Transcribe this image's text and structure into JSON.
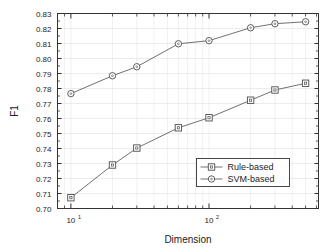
{
  "chart_data": {
    "type": "line",
    "title": "",
    "xlabel": "Dimension",
    "ylabel": "F1",
    "xscale": "log",
    "xlim": [
      8,
      620
    ],
    "ylim": [
      0.7,
      0.83
    ],
    "grid": true,
    "legend_position": "lower right",
    "x": [
      10,
      20,
      30,
      60,
      100,
      200,
      300,
      500
    ],
    "xtick_labels": [
      "10",
      "10"
    ],
    "xtick_exponents": [
      "1",
      "2"
    ],
    "xtick_values": [
      10,
      100
    ],
    "ytick_labels": [
      "0.70",
      "0.71",
      "0.72",
      "0.73",
      "0.74",
      "0.75",
      "0.76",
      "0.77",
      "0.78",
      "0.79",
      "0.80",
      "0.81",
      "0.82",
      "0.83"
    ],
    "ytick_values": [
      0.7,
      0.71,
      0.72,
      0.73,
      0.74,
      0.75,
      0.76,
      0.77,
      0.78,
      0.79,
      0.8,
      0.81,
      0.82,
      0.83
    ],
    "series": [
      {
        "name": "Rule-based",
        "marker": "square",
        "color": "#4d4d4d",
        "values": [
          0.7072,
          0.729,
          0.7403,
          0.7538,
          0.7605,
          0.7722,
          0.779,
          0.7835
        ]
      },
      {
        "name": "SVM-based",
        "marker": "circle",
        "color": "#4d4d4d",
        "values": [
          0.7766,
          0.7885,
          0.7945,
          0.8098,
          0.8119,
          0.8205,
          0.8232,
          0.8245
        ]
      }
    ]
  },
  "legend": {
    "items": [
      {
        "label": "Rule-based",
        "marker": "square"
      },
      {
        "label": "SVM-based",
        "marker": "circle"
      }
    ]
  },
  "axes": {
    "x_title": "Dimension",
    "y_title": "F1"
  }
}
